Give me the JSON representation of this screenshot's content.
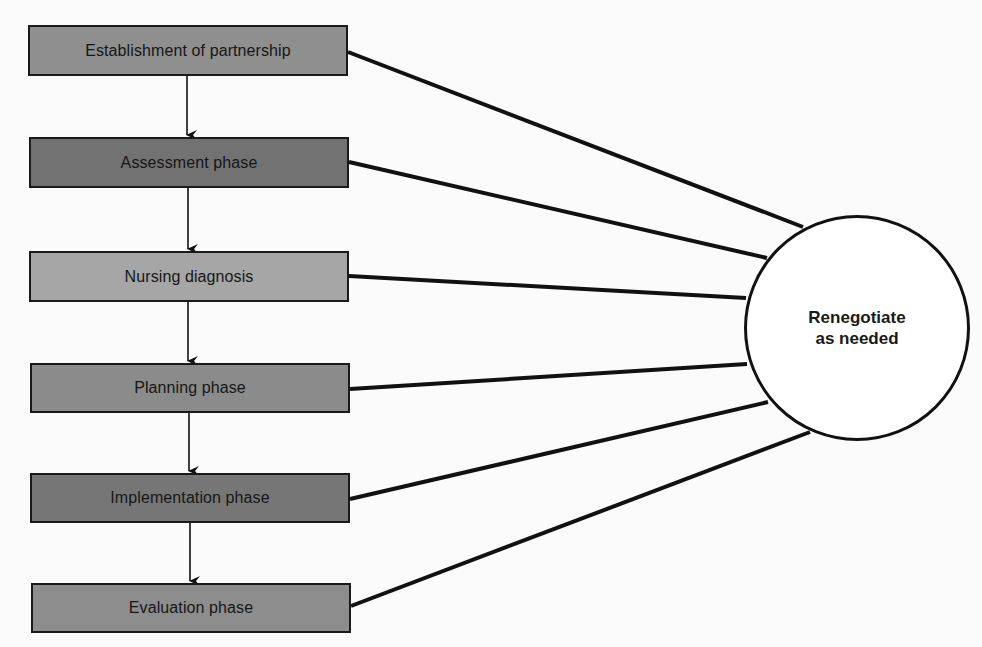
{
  "diagram": {
    "type": "flow-process",
    "phases": [
      {
        "label": "Establishment of partnership",
        "fill": "#8f8f8f",
        "x": 28,
        "y": 25,
        "w": 320,
        "h": 51
      },
      {
        "label": "Assessment phase",
        "fill": "#727272",
        "x": 29,
        "y": 137,
        "w": 320,
        "h": 51
      },
      {
        "label": "Nursing diagnosis",
        "fill": "#a6a6a6",
        "x": 29,
        "y": 251,
        "w": 320,
        "h": 51
      },
      {
        "label": "Planning phase",
        "fill": "#8b8b8b",
        "x": 30,
        "y": 363,
        "w": 320,
        "h": 50
      },
      {
        "label": "Implementation phase",
        "fill": "#767676",
        "x": 30,
        "y": 473,
        "w": 320,
        "h": 50
      },
      {
        "label": "Evaluation phase",
        "fill": "#8d8d8d",
        "x": 31,
        "y": 583,
        "w": 320,
        "h": 50
      }
    ],
    "hub": {
      "line1": "Renegotiate",
      "line2": "as needed",
      "cx": 857,
      "cy": 328,
      "r": 113
    },
    "connectors": [
      {
        "from": [
          348,
          52
        ],
        "to": [
          803,
          227
        ]
      },
      {
        "from": [
          349,
          162
        ],
        "to": [
          767,
          258
        ]
      },
      {
        "from": [
          349,
          276
        ],
        "to": [
          746,
          298
        ]
      },
      {
        "from": [
          350,
          389
        ],
        "to": [
          747,
          364
        ]
      },
      {
        "from": [
          350,
          499
        ],
        "to": [
          768,
          402
        ]
      },
      {
        "from": [
          351,
          606
        ],
        "to": [
          810,
          432
        ]
      }
    ],
    "arrows": [
      {
        "x": 187,
        "y1": 76,
        "y2": 137
      },
      {
        "x": 188,
        "y1": 188,
        "y2": 251
      },
      {
        "x": 188,
        "y1": 302,
        "y2": 363
      },
      {
        "x": 189,
        "y1": 413,
        "y2": 473
      },
      {
        "x": 190,
        "y1": 523,
        "y2": 583
      }
    ],
    "colors": {
      "line": "#111111",
      "background": "#fbfbfb",
      "circle_fill": "#ffffff"
    }
  }
}
